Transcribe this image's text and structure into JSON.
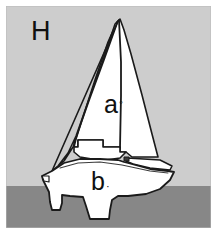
{
  "figure": {
    "labels": [
      {
        "id": "panel",
        "text": "H"
      },
      {
        "id": "sail-area",
        "text": "a",
        "mark": "◦"
      },
      {
        "id": "hull-area",
        "text": "b",
        "mark": "·"
      }
    ],
    "label_h": "H",
    "label_a": "a",
    "label_a_mark": "◦",
    "label_b": "b",
    "label_b_mark": "·",
    "colors": {
      "sky": "#cdcdcd",
      "water": "#878787",
      "sail": "#ffffff",
      "hull": "#ffffff",
      "outline": "#1a1a1a",
      "page": "#ffffff",
      "label_text": "#101010"
    },
    "geometry": {
      "frame": {
        "x": 6,
        "y": 6,
        "width": 205,
        "height": 222
      },
      "waterline_y": 186,
      "mast_top": {
        "x": 120,
        "y": 19
      }
    }
  }
}
